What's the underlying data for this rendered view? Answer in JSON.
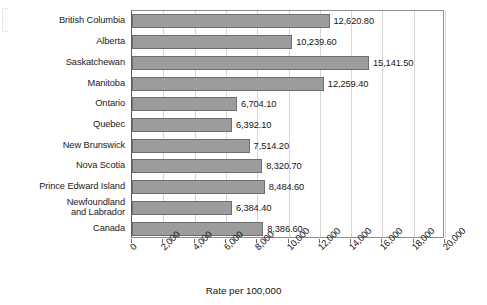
{
  "chart_data": {
    "type": "bar",
    "orientation": "horizontal",
    "title": "",
    "xlabel": "Rate per 100,000",
    "ylabel": "",
    "xlim": [
      0,
      20000
    ],
    "xticks": [
      "0",
      "2,000",
      "4,000",
      "6,000",
      "8,000",
      "10,000",
      "12,000",
      "14,000",
      "16,000",
      "18,000",
      "20,000"
    ],
    "grid": true,
    "legend": "none",
    "categories": [
      "British Columbia",
      "Alberta",
      "Saskatchewan",
      "Manitoba",
      "Ontario",
      "Quebec",
      "New Brunswick",
      "Nova Scotia",
      "Prince Edward Island",
      "Newfoundland\nand Labrador",
      "Canada"
    ],
    "values": [
      12620.8,
      10239.6,
      15141.5,
      12259.4,
      6704.1,
      6392.1,
      7514.2,
      8320.7,
      8484.6,
      6384.4,
      8386.6
    ],
    "value_labels": [
      "12,620.80",
      "10,239.60",
      "15,141.50",
      "12,259.40",
      "6,704.10",
      "6,392.10",
      "7,514.20",
      "8,320.70",
      "8,484.60",
      "6,384.40",
      "8,386.60"
    ],
    "colors": {
      "bar_fill": "#9c9c9c",
      "bar_border": "#6f6f6f",
      "gridline": "#d6d6d6",
      "axis": "#6b6b6b",
      "text": "#161616"
    }
  }
}
